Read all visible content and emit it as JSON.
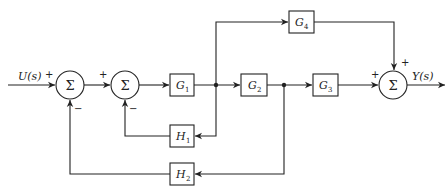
{
  "diagram": {
    "type": "block-diagram",
    "input_label": "U(s)",
    "output_label": "Y(s)",
    "summing_symbol": "Σ",
    "summers": [
      {
        "id": "sum1",
        "inputs": [
          {
            "from": "U(s)",
            "sign": "+"
          },
          {
            "from": "H2",
            "sign": "−"
          }
        ]
      },
      {
        "id": "sum2",
        "inputs": [
          {
            "from": "sum1",
            "sign": "+"
          },
          {
            "from": "H1",
            "sign": "−"
          }
        ]
      },
      {
        "id": "sum3",
        "inputs": [
          {
            "from": "G3",
            "sign": "+"
          },
          {
            "from": "G4",
            "sign": "+"
          }
        ]
      }
    ],
    "blocks": [
      {
        "id": "G1",
        "base": "G",
        "sub": "1"
      },
      {
        "id": "G2",
        "base": "G",
        "sub": "2"
      },
      {
        "id": "G3",
        "base": "G",
        "sub": "3"
      },
      {
        "id": "G4",
        "base": "G",
        "sub": "4"
      },
      {
        "id": "H1",
        "base": "H",
        "sub": "1"
      },
      {
        "id": "H2",
        "base": "H",
        "sub": "2"
      }
    ],
    "signs": {
      "plus": "+",
      "minus": "−"
    },
    "connections": [
      "U(s) → sum1",
      "sum1 → sum2",
      "sum2 → G1",
      "G1 → node1",
      "node1 → G2",
      "node1 → G4",
      "node1 → H1",
      "H1 → sum2",
      "G2 → node2",
      "node2 → G3",
      "node2 → H2",
      "H2 → sum1",
      "G3 → sum3",
      "G4 → sum3",
      "sum3 → Y(s)"
    ]
  }
}
